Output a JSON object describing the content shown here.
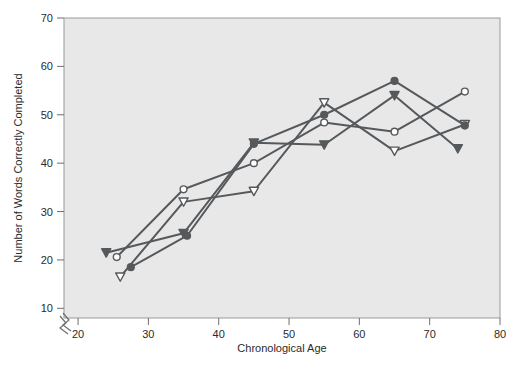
{
  "chart_data": {
    "type": "line",
    "title": "",
    "xlabel": "Chronological Age",
    "ylabel": "Number of Words Correctly Completed",
    "xlim": [
      18,
      80
    ],
    "ylim": [
      8,
      70
    ],
    "xticks": [
      20,
      30,
      40,
      50,
      60,
      70,
      80
    ],
    "yticks": [
      10,
      20,
      30,
      40,
      50,
      60,
      70
    ],
    "grid": false,
    "legend": "none",
    "axis_break": {
      "axis": "x",
      "note": "break symbol near origin between y-axis and first x tick"
    },
    "plot_background": "#e8e8e8",
    "line_color": "#56595c",
    "series": [
      {
        "name": "filled-triangle-down",
        "marker": "triangle-down-filled",
        "color": "#56595c",
        "points": [
          {
            "x": 24.0,
            "y": 21.5
          },
          {
            "x": 35.0,
            "y": 25.5
          },
          {
            "x": 45.0,
            "y": 44.2
          },
          {
            "x": 55.0,
            "y": 43.8
          },
          {
            "x": 65.0,
            "y": 54.0
          },
          {
            "x": 74.0,
            "y": 43.0
          }
        ]
      },
      {
        "name": "open-circle",
        "marker": "circle-open",
        "color": "#56595c",
        "points": [
          {
            "x": 25.5,
            "y": 20.6
          },
          {
            "x": 35.0,
            "y": 34.6
          },
          {
            "x": 45.0,
            "y": 40.0
          },
          {
            "x": 55.0,
            "y": 48.4
          },
          {
            "x": 65.0,
            "y": 46.5
          },
          {
            "x": 75.0,
            "y": 54.8
          }
        ]
      },
      {
        "name": "open-triangle-down",
        "marker": "triangle-down-open",
        "color": "#56595c",
        "points": [
          {
            "x": 26.0,
            "y": 16.5
          },
          {
            "x": 35.0,
            "y": 32.0
          },
          {
            "x": 45.0,
            "y": 34.2
          },
          {
            "x": 55.0,
            "y": 52.5
          },
          {
            "x": 65.0,
            "y": 42.5
          },
          {
            "x": 75.0,
            "y": 48.0
          }
        ]
      },
      {
        "name": "filled-circle",
        "marker": "circle-filled",
        "color": "#56595c",
        "points": [
          {
            "x": 27.5,
            "y": 18.5
          },
          {
            "x": 35.5,
            "y": 25.0
          },
          {
            "x": 45.0,
            "y": 44.0
          },
          {
            "x": 55.0,
            "y": 50.0
          },
          {
            "x": 65.0,
            "y": 57.0
          },
          {
            "x": 75.0,
            "y": 47.8
          }
        ]
      }
    ]
  }
}
